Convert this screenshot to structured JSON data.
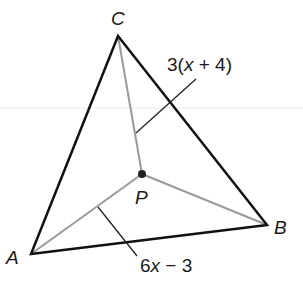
{
  "diagram": {
    "type": "triangle-with-interior-point",
    "vertices": {
      "A": {
        "label": "A",
        "x": 31,
        "y": 254
      },
      "B": {
        "label": "B",
        "x": 267,
        "y": 225
      },
      "C": {
        "label": "C",
        "x": 118,
        "y": 36
      }
    },
    "interior_point": {
      "label": "P",
      "x": 142,
      "y": 174
    },
    "segments": [
      {
        "from": "P",
        "to": "A",
        "label": "6x − 3"
      },
      {
        "from": "P",
        "to": "B",
        "label": ""
      },
      {
        "from": "P",
        "to": "C",
        "label": "3(x + 4)"
      }
    ],
    "labels": {
      "A": "A",
      "B": "B",
      "C": "C",
      "P": "P",
      "pc_length": {
        "prefix": "3(",
        "var": "x",
        "suffix": " + 4)"
      },
      "pa_length": {
        "prefix": "6",
        "var": "x",
        "suffix": " − 3"
      }
    },
    "colors": {
      "triangle_edge": "#111111",
      "inner_segment": "#9a9a9a",
      "point": "#222222",
      "leader": "#222222",
      "guide_line": "#ececec"
    }
  }
}
